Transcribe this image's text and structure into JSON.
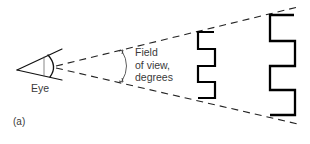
{
  "figure": {
    "panel_label": "(a)",
    "eye_label": "Eye",
    "fov_label": {
      "line1": "Field",
      "line2": "of view,",
      "line3": "degrees"
    },
    "colors": {
      "line": "#111111",
      "text": "#3a3a3a",
      "background": "#ffffff"
    },
    "elements": [
      "eye",
      "upper-sight-line-dashed",
      "lower-sight-line-dashed",
      "field-of-view-arc",
      "near-grating-target",
      "far-grating-target"
    ]
  }
}
